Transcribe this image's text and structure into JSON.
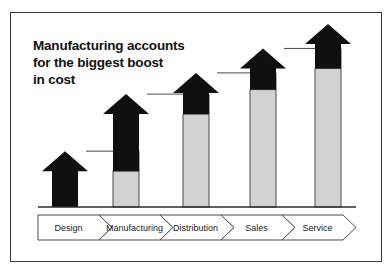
{
  "title": {
    "line1": "Manufacturing accounts",
    "line2": "for the biggest boost",
    "line3": "in cost"
  },
  "colors": {
    "boost": "#101010",
    "base": "#d2d2d2",
    "outline": "#4a4a4a",
    "frame": "#3a3a3a",
    "axis": "#2b2b2b",
    "text": "#111111",
    "background": "#ffffff"
  },
  "chart_data": {
    "type": "bar",
    "title": "Manufacturing accounts for the biggest boost in cost",
    "xlabel": "",
    "ylabel": "",
    "grid": false,
    "legend": "none",
    "stacked": true,
    "ylim": [
      0,
      100
    ],
    "categories": [
      "Design",
      "Manufacturing",
      "Distribution",
      "Sales",
      "Service"
    ],
    "series": [
      {
        "name": "Base cost",
        "values": [
          0,
          22,
          57,
          72,
          85
        ]
      },
      {
        "name": "Boost",
        "values": [
          22,
          35,
          13,
          13,
          15
        ]
      }
    ],
    "totals": [
      22,
      57,
      70,
      85,
      100
    ],
    "annotations": [
      "Each bar's black segment shows the cost boost added at that stage",
      "Connector lines link each arrow tip to the next stage's base level"
    ]
  },
  "process_band": {
    "steps": [
      {
        "label": "Design"
      },
      {
        "label": "Manufacturing"
      },
      {
        "label": "Distribution"
      },
      {
        "label": "Sales"
      },
      {
        "label": "Service"
      }
    ]
  }
}
